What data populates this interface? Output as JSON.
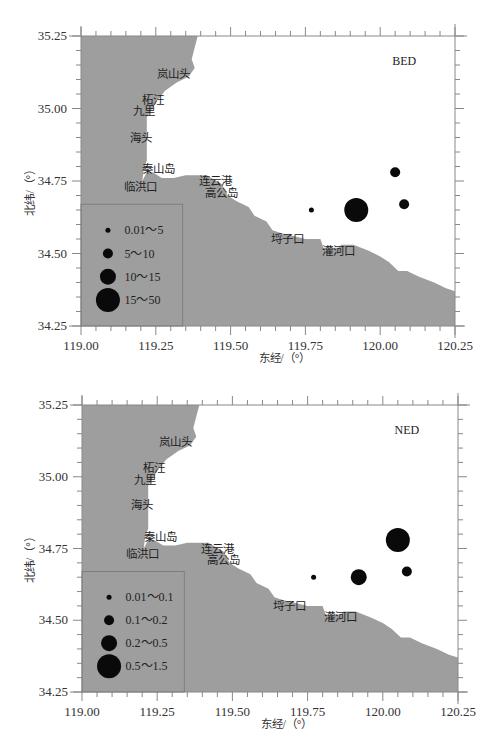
{
  "figure": {
    "land_color": "#9e9e9e",
    "sea_color": "#ffffff",
    "axis_color": "#888888",
    "marker_color": "#0a0a0a"
  },
  "chart_data": [
    {
      "type": "scatter",
      "title": "BED",
      "xlabel": "东经/（°）",
      "ylabel": "北纬/（°）",
      "xlim": [
        119.0,
        120.25
      ],
      "ylim": [
        34.25,
        35.25
      ],
      "xticks": [
        "119.00",
        "119.25",
        "119.50",
        "119.75",
        "120.00",
        "120.25"
      ],
      "yticks": [
        "34.25",
        "34.50",
        "34.75",
        "35.00",
        "35.25"
      ],
      "grid": false,
      "legend_position": "lower-left",
      "legend": [
        {
          "label": "0.01～5",
          "size_class": 1
        },
        {
          "label": "5～10",
          "size_class": 2
        },
        {
          "label": "10～15",
          "size_class": 3
        },
        {
          "label": "15～50",
          "size_class": 4
        }
      ],
      "points": [
        {
          "lon": 119.77,
          "lat": 34.65,
          "size_class": 1
        },
        {
          "lon": 119.92,
          "lat": 34.65,
          "size_class": 4
        },
        {
          "lon": 120.05,
          "lat": 34.78,
          "size_class": 2
        },
        {
          "lon": 120.08,
          "lat": 34.67,
          "size_class": 2
        }
      ],
      "places": [
        {
          "name": "岚山头",
          "lon": 119.31,
          "lat": 35.12
        },
        {
          "name": "柘汪",
          "lon": 119.24,
          "lat": 35.03
        },
        {
          "name": "九里",
          "lon": 119.21,
          "lat": 34.99
        },
        {
          "name": "海头",
          "lon": 119.2,
          "lat": 34.9
        },
        {
          "name": "秦山岛",
          "lon": 119.26,
          "lat": 34.79
        },
        {
          "name": "临洪口",
          "lon": 119.2,
          "lat": 34.73
        },
        {
          "name": "连云港",
          "lon": 119.45,
          "lat": 34.75
        },
        {
          "name": "高公岛",
          "lon": 119.47,
          "lat": 34.71
        },
        {
          "name": "埒子口",
          "lon": 119.69,
          "lat": 34.55
        },
        {
          "name": "灌河口",
          "lon": 119.86,
          "lat": 34.51
        }
      ]
    },
    {
      "type": "scatter",
      "title": "NED",
      "xlabel": "东经/（°）",
      "ylabel": "北纬/（°）",
      "xlim": [
        119.0,
        120.25
      ],
      "ylim": [
        34.25,
        35.25
      ],
      "xticks": [
        "119.00",
        "119.25",
        "119.50",
        "119.75",
        "120.00",
        "120.25"
      ],
      "yticks": [
        "34.25",
        "34.50",
        "34.75",
        "35.00",
        "35.25"
      ],
      "grid": false,
      "legend_position": "lower-left",
      "legend": [
        {
          "label": "0.01～0.1",
          "size_class": 1
        },
        {
          "label": "0.1～0.2",
          "size_class": 2
        },
        {
          "label": "0.2～0.5",
          "size_class": 3
        },
        {
          "label": "0.5～1.5",
          "size_class": 4
        }
      ],
      "points": [
        {
          "lon": 119.77,
          "lat": 34.65,
          "size_class": 1
        },
        {
          "lon": 119.92,
          "lat": 34.65,
          "size_class": 3
        },
        {
          "lon": 120.05,
          "lat": 34.78,
          "size_class": 4
        },
        {
          "lon": 120.08,
          "lat": 34.67,
          "size_class": 2
        }
      ],
      "places": [
        {
          "name": "岚山头",
          "lon": 119.31,
          "lat": 35.12
        },
        {
          "name": "柘汪",
          "lon": 119.24,
          "lat": 35.03
        },
        {
          "name": "九里",
          "lon": 119.21,
          "lat": 34.99
        },
        {
          "name": "海头",
          "lon": 119.2,
          "lat": 34.9
        },
        {
          "name": "秦山岛",
          "lon": 119.26,
          "lat": 34.79
        },
        {
          "name": "临洪口",
          "lon": 119.2,
          "lat": 34.73
        },
        {
          "name": "连云港",
          "lon": 119.45,
          "lat": 34.75
        },
        {
          "name": "高公岛",
          "lon": 119.47,
          "lat": 34.71
        },
        {
          "name": "埒子口",
          "lon": 119.69,
          "lat": 34.55
        },
        {
          "name": "灌河口",
          "lon": 119.86,
          "lat": 34.51
        }
      ]
    }
  ],
  "marker_radii": {
    "1": 2.5,
    "2": 5,
    "3": 8,
    "4": 12
  },
  "coastline": [
    [
      119.0,
      35.25
    ],
    [
      119.39,
      35.25
    ],
    [
      119.38,
      35.21
    ],
    [
      119.37,
      35.17
    ],
    [
      119.38,
      35.14
    ],
    [
      119.36,
      35.11
    ],
    [
      119.32,
      35.09
    ],
    [
      119.28,
      35.06
    ],
    [
      119.25,
      35.02
    ],
    [
      119.22,
      34.97
    ],
    [
      119.22,
      34.9
    ],
    [
      119.22,
      34.82
    ],
    [
      119.21,
      34.79
    ],
    [
      119.205,
      34.75
    ],
    [
      119.22,
      34.78
    ],
    [
      119.24,
      34.78
    ],
    [
      119.27,
      34.76
    ],
    [
      119.31,
      34.76
    ],
    [
      119.35,
      34.77
    ],
    [
      119.42,
      34.77
    ],
    [
      119.47,
      34.74
    ],
    [
      119.49,
      34.7
    ],
    [
      119.52,
      34.68
    ],
    [
      119.56,
      34.66
    ],
    [
      119.58,
      34.63
    ],
    [
      119.62,
      34.61
    ],
    [
      119.64,
      34.58
    ],
    [
      119.67,
      34.57
    ],
    [
      119.71,
      34.56
    ],
    [
      119.75,
      34.55
    ],
    [
      119.8,
      34.55
    ],
    [
      119.81,
      34.52
    ],
    [
      119.86,
      34.52
    ],
    [
      119.87,
      34.53
    ],
    [
      119.91,
      34.53
    ],
    [
      119.96,
      34.51
    ],
    [
      120.0,
      34.49
    ],
    [
      120.03,
      34.47
    ],
    [
      120.06,
      34.44
    ],
    [
      120.09,
      34.44
    ],
    [
      120.13,
      34.42
    ],
    [
      120.18,
      34.4
    ],
    [
      120.22,
      34.38
    ],
    [
      120.25,
      34.37
    ],
    [
      120.25,
      34.25
    ],
    [
      119.0,
      34.25
    ]
  ]
}
